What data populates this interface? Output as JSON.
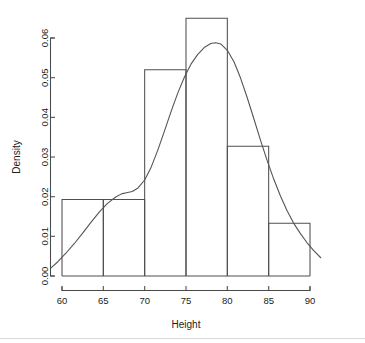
{
  "chart_data": {
    "type": "bar",
    "title": "",
    "subtitle": "",
    "xlabel": "Height",
    "ylabel": "Density",
    "xlim": [
      58.5,
      91.5
    ],
    "ylim": [
      0.0,
      0.066
    ],
    "grid": false,
    "legend": null,
    "bin_width": 5,
    "bin_edges": [
      60,
      65,
      70,
      75,
      80,
      85,
      90
    ],
    "categories": [
      "60-65",
      "65-70",
      "70-75",
      "75-80",
      "80-85",
      "85-90"
    ],
    "values": [
      0.0193,
      0.0193,
      0.052,
      0.065,
      0.0327,
      0.0133
    ],
    "xticks": [
      60,
      65,
      70,
      75,
      80,
      85,
      90
    ],
    "xtick_labels": [
      "60",
      "65",
      "70",
      "75",
      "80",
      "85",
      "90"
    ],
    "yticks": [
      0.0,
      0.01,
      0.02,
      0.03,
      0.04,
      0.05,
      0.06
    ],
    "ytick_labels": [
      "0.00",
      "0.01",
      "0.02",
      "0.03",
      "0.04",
      "0.05",
      "0.06"
    ],
    "series": [
      {
        "name": "Histogram",
        "type": "bar",
        "values": [
          0.0193,
          0.0193,
          0.052,
          0.065,
          0.0327,
          0.0133
        ]
      },
      {
        "name": "Density curve",
        "type": "line",
        "x": [
          58.6,
          59.5,
          60.5,
          61.5,
          62.5,
          63.5,
          64.5,
          65.5,
          66.5,
          67.2,
          67.8,
          68.5,
          69.2,
          70.0,
          70.8,
          71.6,
          72.4,
          73.2,
          74.0,
          74.8,
          75.6,
          76.4,
          77.2,
          78.0,
          78.6,
          79.2,
          80.0,
          80.8,
          81.6,
          82.4,
          83.2,
          84.0,
          84.8,
          85.6,
          86.4,
          87.2,
          88.0,
          88.8,
          89.6,
          90.4,
          91.3
        ],
        "y": [
          0.0019,
          0.0036,
          0.0058,
          0.0082,
          0.0108,
          0.0135,
          0.0161,
          0.0183,
          0.0199,
          0.0207,
          0.021,
          0.0213,
          0.0222,
          0.0242,
          0.0275,
          0.0318,
          0.0366,
          0.0415,
          0.0461,
          0.0501,
          0.0534,
          0.0558,
          0.0576,
          0.0586,
          0.0588,
          0.0585,
          0.0569,
          0.054,
          0.0499,
          0.045,
          0.0397,
          0.0343,
          0.0292,
          0.0245,
          0.0203,
          0.0166,
          0.0134,
          0.0108,
          0.0085,
          0.0065,
          0.0046
        ]
      }
    ],
    "colors": {
      "bar_stroke": "#4f4f4f",
      "bar_fill": "none",
      "curve": "#555555",
      "axis": "#4a4a4a",
      "text": "#1b1b1b",
      "background": "#ffffff"
    }
  }
}
